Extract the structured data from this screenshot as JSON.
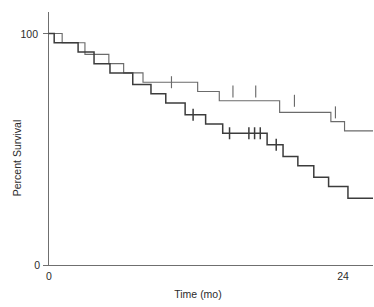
{
  "chart_data": {
    "type": "line",
    "title": "",
    "subtitle": "",
    "xlabel": "Time (mo)",
    "ylabel": "Percent Survival",
    "xlim": [
      0,
      28.5
    ],
    "ylim": [
      0,
      106
    ],
    "grid": false,
    "legend": "none",
    "annotations": [],
    "x_ticks": [
      {
        "value": 0,
        "label": "0"
      },
      {
        "value": 24,
        "label": "24"
      }
    ],
    "y_ticks": [
      {
        "value": 0,
        "label": "0"
      },
      {
        "value": 100,
        "label": "100"
      }
    ],
    "series": [
      {
        "name": "upper-survival-curve",
        "style": "step",
        "color": "#6b6b6b",
        "x": [
          0.0,
          1.2,
          1.2,
          3.2,
          3.2,
          5.3,
          5.3,
          6.6,
          6.6,
          8.3,
          8.3,
          13.1,
          13.1,
          15.0,
          15.0,
          20.3,
          20.3,
          24.8,
          24.8,
          26.0,
          26.0,
          28.5
        ],
        "y": [
          100,
          100,
          96,
          96,
          91,
          91,
          87,
          87,
          83,
          83,
          79,
          79,
          75,
          75,
          71,
          71,
          66,
          66,
          62,
          62,
          58,
          58
        ],
        "censored_x": [
          10.8,
          16.2,
          18.2,
          21.6,
          25.2
        ],
        "censored_y": [
          79,
          75,
          75,
          71,
          66
        ]
      },
      {
        "name": "lower-survival-curve",
        "style": "step",
        "color": "#3c3c3c",
        "x": [
          0.0,
          0.5,
          0.5,
          2.6,
          2.6,
          4.0,
          4.0,
          5.4,
          5.4,
          7.4,
          7.4,
          9.0,
          9.0,
          10.3,
          10.3,
          12.0,
          12.0,
          13.8,
          13.8,
          15.3,
          15.3,
          19.2,
          19.2,
          20.6,
          20.6,
          21.9,
          21.9,
          23.3,
          23.3,
          24.6,
          24.6,
          26.3,
          26.3,
          28.5
        ],
        "y": [
          100,
          100,
          96,
          96,
          92,
          92,
          87,
          87,
          83,
          83,
          78,
          78,
          74,
          74,
          70,
          70,
          65,
          65,
          61,
          61,
          57,
          57,
          52,
          52,
          47,
          47,
          43,
          43,
          38,
          38,
          34,
          34,
          29,
          29
        ],
        "censored_x": [
          12.7,
          15.9,
          17.6,
          18.1,
          18.6,
          20.0
        ],
        "censored_y": [
          65,
          57,
          57,
          57,
          57,
          52
        ]
      }
    ]
  },
  "axes": {
    "y_label_text": "Percent Survival",
    "x_label_text": "Time (mo)",
    "y_max_label": "100",
    "y_min_label": "0",
    "x_min_label": "0",
    "x_mid_label": "24"
  },
  "colors": {
    "background": "#ffffff",
    "axis": "#6f6f6f",
    "curve_upper": "#6b6b6b",
    "curve_lower": "#3c3c3c",
    "text": "#2b2b2b"
  }
}
